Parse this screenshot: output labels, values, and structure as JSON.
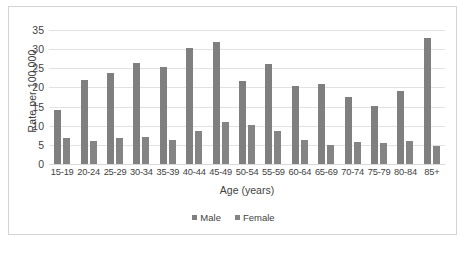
{
  "chart_data": {
    "type": "bar",
    "title": "",
    "xlabel": "Age (years)",
    "ylabel": "Rate per 100,000",
    "ylim": [
      0,
      35
    ],
    "yticks": [
      0,
      5,
      10,
      15,
      20,
      25,
      30,
      35
    ],
    "grid": true,
    "legend_position": "bottom",
    "categories": [
      "15-19",
      "20-24",
      "25-29",
      "30-34",
      "35-39",
      "40-44",
      "45-49",
      "50-54",
      "55-59",
      "60-64",
      "65-69",
      "70-74",
      "75-79",
      "80-84",
      "85+"
    ],
    "series": [
      {
        "name": "Male",
        "color": "#7f7f7f",
        "values": [
          14.0,
          22.0,
          23.8,
          26.3,
          25.4,
          30.2,
          31.9,
          21.7,
          26.1,
          20.4,
          20.9,
          17.5,
          15.2,
          19.2,
          32.8
        ]
      },
      {
        "name": "Female",
        "color": "#848484",
        "values": [
          6.7,
          6.1,
          6.9,
          7.0,
          6.3,
          8.5,
          10.9,
          10.3,
          8.5,
          6.2,
          5.0,
          5.7,
          5.5,
          6.0,
          4.7
        ]
      }
    ]
  },
  "legend": {
    "items": [
      {
        "label": "Male"
      },
      {
        "label": "Female"
      }
    ]
  },
  "caption": ""
}
